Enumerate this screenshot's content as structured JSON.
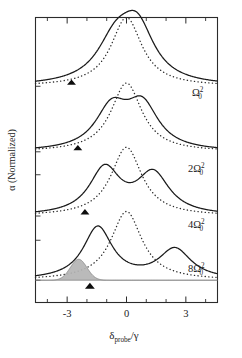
{
  "figure": {
    "kind": "absorption-spectra-figure",
    "background": "#ffffff",
    "ink": "#1a1a1a",
    "shade_color": "#b4b4b4"
  },
  "axes": {
    "x": {
      "label_main": "δ",
      "label_sub": "probe",
      "label_div": "/γ",
      "label_plain": "δprobe/γ",
      "min": -4.6,
      "max": 4.6,
      "major_ticks": [
        -3,
        0,
        3
      ],
      "major_tick_labels": [
        "-3",
        "0",
        "3"
      ],
      "minor_ticks": [
        -4,
        -2,
        -1,
        1,
        2,
        4
      ]
    },
    "y": {
      "label": "α (Normalized)",
      "ticks_visible": true,
      "tick_count": 6
    }
  },
  "series_labels": [
    {
      "prefix": "",
      "symbol": "Ω",
      "sub": "0",
      "sup": "2",
      "plain": "Ω₀²"
    },
    {
      "prefix": "2",
      "symbol": "Ω",
      "sub": "0",
      "sup": "2",
      "plain": "2Ω₀²"
    },
    {
      "prefix": "4",
      "symbol": "Ω",
      "sub": "0",
      "sup": "2",
      "plain": "4Ω₀²"
    },
    {
      "prefix": "8",
      "symbol": "Ω",
      "sub": "0",
      "sup": "2",
      "plain": "8Ω₀²"
    }
  ],
  "chart_data": {
    "type": "line",
    "title": "",
    "xlabel": "δprobe/γ",
    "ylabel": "α (Normalized)",
    "xlim": [
      -4.6,
      4.6
    ],
    "ylim": [
      0,
      4.35
    ],
    "grid": false,
    "legend_position": "inline-right",
    "xticks": [
      -3,
      0,
      3
    ],
    "xticklabels": [
      "-3",
      "0",
      "3"
    ],
    "series": [
      {
        "name": "Ω₀²",
        "style": "solid",
        "baseline": 3.3,
        "peaks": [
          {
            "center": -0.55,
            "height": 0.62,
            "width": 1.15
          },
          {
            "center": 0.55,
            "height": 0.8,
            "width": 1.05
          }
        ],
        "splitting": 1.1,
        "shape": "broad single peak with left shoulder"
      },
      {
        "name": "Ω₀²-reference",
        "style": "dotted",
        "baseline": 3.3,
        "peaks": [
          {
            "center": 0.0,
            "height": 1.05,
            "width": 0.95
          }
        ],
        "shape": "single lorentzian"
      },
      {
        "name": "2Ω₀²",
        "style": "solid",
        "baseline": 2.3,
        "peaks": [
          {
            "center": -0.75,
            "height": 0.62,
            "width": 1.0
          },
          {
            "center": 0.8,
            "height": 0.66,
            "width": 1.0
          }
        ],
        "splitting": 1.55,
        "shape": "resolved doublet, shallow central dip"
      },
      {
        "name": "2Ω₀²-reference",
        "style": "dotted",
        "baseline": 2.3,
        "peaks": [
          {
            "center": 0.0,
            "height": 1.05,
            "width": 0.95
          }
        ],
        "shape": "single lorentzian"
      },
      {
        "name": "4Ω₀²",
        "style": "solid",
        "baseline": 1.32,
        "peaks": [
          {
            "center": -1.1,
            "height": 0.7,
            "width": 0.95
          },
          {
            "center": 1.35,
            "height": 0.62,
            "width": 1.0
          }
        ],
        "splitting": 2.45,
        "shape": "well separated doublet"
      },
      {
        "name": "4Ω₀²-reference",
        "style": "dotted",
        "baseline": 1.32,
        "peaks": [
          {
            "center": 0.0,
            "height": 1.05,
            "width": 0.95
          }
        ],
        "shape": "single lorentzian"
      },
      {
        "name": "8Ω₀²",
        "style": "solid",
        "baseline": 0.34,
        "peaks": [
          {
            "center": -1.45,
            "height": 0.8,
            "width": 0.9
          },
          {
            "center": 2.45,
            "height": 0.46,
            "width": 1.0
          }
        ],
        "splitting": 3.9,
        "shape": "widest doublet, asymmetric heights"
      },
      {
        "name": "8Ω₀²-reference",
        "style": "dotted",
        "baseline": 0.34,
        "peaks": [
          {
            "center": 0.0,
            "height": 1.05,
            "width": 0.95
          }
        ],
        "shape": "single lorentzian"
      },
      {
        "name": "shaded-probe-peak",
        "style": "filled",
        "baseline": 0.34,
        "peaks": [
          {
            "center": -2.42,
            "height": 0.32,
            "width": 0.42
          }
        ],
        "fill": "#b4b4b4",
        "shape": "narrow gaussian, gray filled"
      }
    ],
    "markers": [
      {
        "shape": "triangle-up",
        "x": -2.78,
        "row": 1,
        "color": "#0d0d0d"
      },
      {
        "shape": "triangle-up",
        "x": -2.46,
        "row": 2,
        "color": "#0d0d0d"
      },
      {
        "shape": "triangle-up",
        "x": -2.1,
        "row": 3,
        "color": "#0d0d0d"
      },
      {
        "shape": "triangle-up",
        "x": -1.85,
        "row": 4,
        "color": "#0d0d0d"
      }
    ]
  }
}
